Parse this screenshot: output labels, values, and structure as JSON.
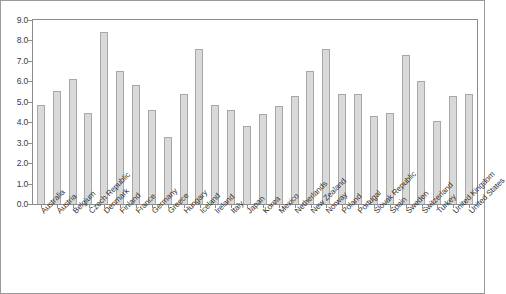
{
  "chart_data": {
    "type": "bar",
    "title": "",
    "subtitle": "",
    "xlabel": "",
    "ylabel": "",
    "ylim": [
      0.0,
      9.0
    ],
    "ytick_step": 1.0,
    "grid": false,
    "legend": "none",
    "bar_color": "#d9d9d9",
    "bar_border_color": "#a8a8a8",
    "axis_color": "#8c8c8c",
    "ytick_labels": [
      "9.0",
      "8.0",
      "7.0",
      "6.0",
      "5.0",
      "4.0",
      "3.0",
      "2.0",
      "1.0",
      "0.0"
    ],
    "ytick_values": [
      9.0,
      8.0,
      7.0,
      6.0,
      5.0,
      4.0,
      3.0,
      2.0,
      1.0,
      0.0
    ],
    "categories": [
      "Australia",
      "Austria",
      "Belgium",
      "Czech Republic",
      "Denmark",
      "Finland",
      "France",
      "Germany",
      "Greece",
      "Hungary",
      "Iceland",
      "Ireland",
      "Italy",
      "Japan",
      "Korea",
      "Mexico",
      "Netherlands",
      "New Zealand",
      "Norway",
      "Poland",
      "Portugal",
      "Slovak Republic",
      "Spain",
      "Sweden",
      "Switzerland",
      "Turkey",
      "United Kingdom",
      "United States"
    ],
    "values": [
      4.85,
      5.55,
      6.1,
      4.45,
      8.4,
      6.5,
      5.8,
      4.6,
      3.3,
      5.4,
      7.6,
      4.85,
      4.6,
      3.8,
      4.4,
      4.8,
      5.3,
      6.5,
      7.6,
      5.4,
      5.4,
      4.3,
      4.45,
      7.3,
      6.0,
      4.05,
      5.3,
      5.4
    ]
  }
}
